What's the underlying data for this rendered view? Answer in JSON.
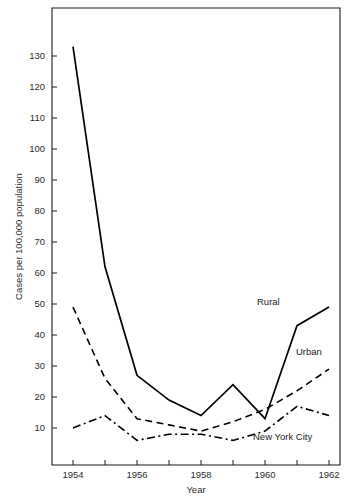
{
  "chart_data": {
    "type": "line",
    "title": "",
    "xlabel": "Year",
    "ylabel": "Cases per 100,000 population",
    "x": [
      1954,
      1955,
      1956,
      1957,
      1958,
      1959,
      1960,
      1961,
      1962
    ],
    "xlim": [
      1953.6,
      1962.4
    ],
    "ylim": [
      4,
      136
    ],
    "xticks": [
      "1954",
      "1955",
      "1956",
      "1957",
      "1958",
      "1959",
      "1960",
      "1961",
      "1962"
    ],
    "xtick_labels_shown": [
      "1954",
      "1956",
      "1958",
      "1960",
      "1962"
    ],
    "yticks": [
      10,
      20,
      30,
      40,
      50,
      60,
      70,
      80,
      90,
      100,
      110,
      120,
      130
    ],
    "grid": false,
    "legend_position": "inline-right",
    "series": [
      {
        "name": "Rural",
        "style": "solid",
        "color": "#000000",
        "label_text": "Rural",
        "values": [
          133,
          62,
          27,
          19,
          14,
          24,
          13,
          43,
          49
        ]
      },
      {
        "name": "Urban",
        "style": "dashed",
        "color": "#000000",
        "label_text": "Urban",
        "values": [
          49,
          26,
          13,
          11,
          9,
          12,
          16,
          22,
          29
        ]
      },
      {
        "name": "New York City",
        "style": "dashdot",
        "color": "#000000",
        "label_text": "New York City",
        "values": [
          10,
          14,
          6,
          8,
          8,
          6,
          9,
          17,
          14
        ]
      }
    ]
  },
  "axes": {
    "x_title": "Year",
    "y_title": "Cases per 100,000 population"
  },
  "caption": {
    "text": ""
  }
}
